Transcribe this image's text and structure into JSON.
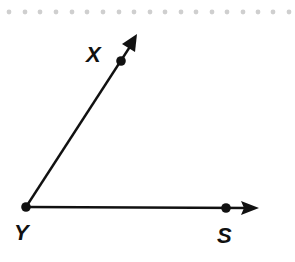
{
  "diagram": {
    "type": "angle",
    "name": "Angle XYS",
    "vertex": {
      "label": "Y",
      "x": 26,
      "y": 207
    },
    "rays": [
      {
        "name": "ray-YX",
        "from": "Y",
        "through": {
          "label": "X",
          "x": 121,
          "y": 61
        },
        "tip": {
          "x": 137,
          "y": 35
        }
      },
      {
        "name": "ray-YS",
        "from": "Y",
        "through": {
          "label": "S",
          "x": 226,
          "y": 208
        },
        "tip": {
          "x": 258,
          "y": 208
        }
      }
    ],
    "labels": {
      "x": "X",
      "y": "Y",
      "s": "S"
    },
    "colors": {
      "line": "#111111",
      "dots": "#cfcfcf"
    }
  }
}
